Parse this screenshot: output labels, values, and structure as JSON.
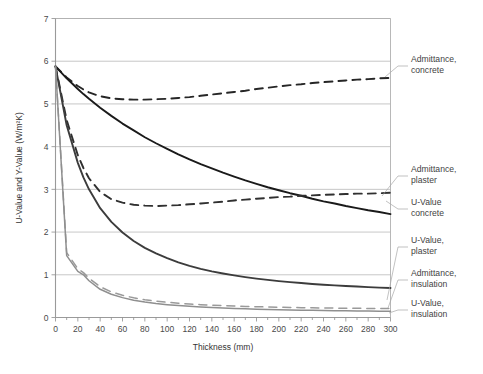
{
  "chart_data": {
    "type": "line",
    "title": "",
    "xlabel": "Thickness (mm)",
    "ylabel": "U-Value and Y-Value (W/m²K)",
    "xlim": [
      0,
      300
    ],
    "ylim": [
      0,
      7
    ],
    "xticks": [
      0,
      20,
      40,
      60,
      80,
      100,
      120,
      140,
      160,
      180,
      200,
      220,
      240,
      260,
      280,
      300
    ],
    "yticks": [
      0,
      1,
      2,
      3,
      4,
      5,
      6,
      7
    ],
    "grid": "horizontal",
    "legend_position": "right-callouts",
    "x": [
      0,
      10,
      20,
      25,
      30,
      40,
      50,
      60,
      70,
      80,
      90,
      100,
      110,
      120,
      130,
      140,
      150,
      160,
      170,
      180,
      190,
      200,
      210,
      220,
      230,
      240,
      250,
      260,
      270,
      280,
      290,
      300
    ],
    "series": [
      {
        "name": "Admittance, concrete",
        "style": "dashed",
        "color": "#262626",
        "values": [
          5.88,
          5.62,
          5.42,
          5.34,
          5.27,
          5.18,
          5.13,
          5.11,
          5.1,
          5.1,
          5.11,
          5.12,
          5.14,
          5.16,
          5.19,
          5.22,
          5.25,
          5.28,
          5.31,
          5.35,
          5.38,
          5.41,
          5.44,
          5.46,
          5.49,
          5.51,
          5.53,
          5.55,
          5.57,
          5.58,
          5.6,
          5.61
        ]
      },
      {
        "name": "U-Value concrete",
        "style": "solid",
        "color": "#1a1a1a",
        "values": [
          5.88,
          5.6,
          5.35,
          5.23,
          5.12,
          4.91,
          4.72,
          4.54,
          4.38,
          4.22,
          4.08,
          3.95,
          3.82,
          3.7,
          3.59,
          3.49,
          3.39,
          3.3,
          3.21,
          3.13,
          3.05,
          2.98,
          2.91,
          2.85,
          2.78,
          2.72,
          2.67,
          2.61,
          2.56,
          2.51,
          2.47,
          2.42
        ]
      },
      {
        "name": "Admittance, plaster",
        "style": "dashed",
        "color": "#303030",
        "values": [
          5.88,
          4.62,
          3.8,
          3.5,
          3.26,
          2.94,
          2.77,
          2.69,
          2.64,
          2.62,
          2.61,
          2.62,
          2.63,
          2.65,
          2.67,
          2.69,
          2.71,
          2.74,
          2.76,
          2.78,
          2.8,
          2.82,
          2.83,
          2.85,
          2.86,
          2.87,
          2.88,
          2.89,
          2.9,
          2.9,
          2.91,
          2.92
        ]
      },
      {
        "name": "U-Value, plaster",
        "style": "solid",
        "color": "#3c3c3c",
        "values": [
          5.88,
          4.5,
          3.62,
          3.28,
          3.0,
          2.56,
          2.24,
          1.99,
          1.79,
          1.63,
          1.5,
          1.39,
          1.29,
          1.21,
          1.14,
          1.08,
          1.03,
          0.985,
          0.945,
          0.91,
          0.88,
          0.852,
          0.828,
          0.806,
          0.786,
          0.768,
          0.752,
          0.737,
          0.724,
          0.712,
          0.7,
          0.69
        ]
      },
      {
        "name": "Admittance, insulation",
        "style": "dashed",
        "color": "#9a9a9a",
        "values": [
          5.88,
          1.52,
          1.14,
          1.05,
          0.92,
          0.72,
          0.6,
          0.52,
          0.46,
          0.415,
          0.382,
          0.356,
          0.334,
          0.316,
          0.301,
          0.288,
          0.277,
          0.268,
          0.26,
          0.253,
          0.246,
          0.241,
          0.236,
          0.231,
          0.227,
          0.224,
          0.22,
          0.217,
          0.215,
          0.212,
          0.21,
          0.208
        ]
      },
      {
        "name": "U-Value, insulation",
        "style": "solid",
        "color": "#8f8f8f",
        "values": [
          5.88,
          1.45,
          1.08,
          1.0,
          0.86,
          0.66,
          0.545,
          0.465,
          0.405,
          0.362,
          0.328,
          0.301,
          0.279,
          0.261,
          0.245,
          0.232,
          0.221,
          0.211,
          0.203,
          0.195,
          0.188,
          0.182,
          0.177,
          0.172,
          0.168,
          0.164,
          0.16,
          0.157,
          0.154,
          0.151,
          0.149,
          0.146
        ]
      }
    ],
    "callouts": [
      {
        "label_line1": "Admittance,",
        "label_line2": "concrete"
      },
      {
        "label_line1": "Admittance,",
        "label_line2": "plaster"
      },
      {
        "label_line1": "U-Value",
        "label_line2": "concrete"
      },
      {
        "label_line1": "U-Value,",
        "label_line2": "plaster"
      },
      {
        "label_line1": "Admittance,",
        "label_line2": "insulation"
      },
      {
        "label_line1": "U-Value,",
        "label_line2": "insulation"
      }
    ]
  }
}
